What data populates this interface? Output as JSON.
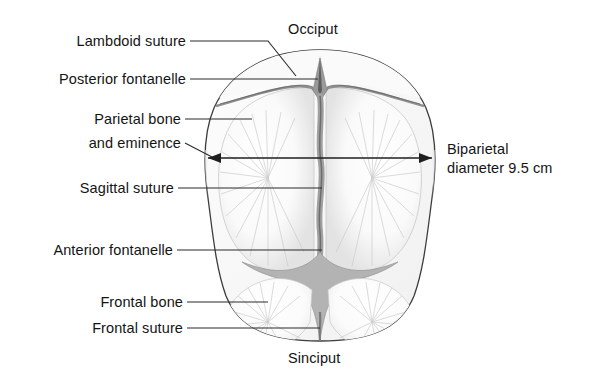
{
  "figure": {
    "background_color": "#ffffff",
    "ink_color": "#141414"
  },
  "labels": {
    "lambdoid_suture": "Lambdoid suture",
    "posterior_fontanelle": "Posterior fontanelle",
    "parietal_bone_line1": "Parietal bone",
    "parietal_bone_line2": "and eminence",
    "sagittal_suture": "Sagittal suture",
    "anterior_fontanelle": "Anterior fontanelle",
    "frontal_bone": "Frontal bone",
    "frontal_suture": "Frontal suture",
    "occiput": "Occiput",
    "sinciput": "Sinciput",
    "biparietal_line1": "Biparietal",
    "biparietal_line2": "diameter 9.5 cm"
  },
  "measurement": {
    "name": "Biparietal diameter",
    "value": "9.5",
    "unit": "cm",
    "display": "diameter 9.5 cm"
  },
  "colors": {
    "outline": "#3c3c3c",
    "bone_fill": "#fbfbfb",
    "bone_shade": "#ececec",
    "fontanelle_fill": "#b3b3b3",
    "suture_gray": "#8a8a8a",
    "radiating_line": "#c9c9c9",
    "leader_line": "#2b2b2b"
  }
}
